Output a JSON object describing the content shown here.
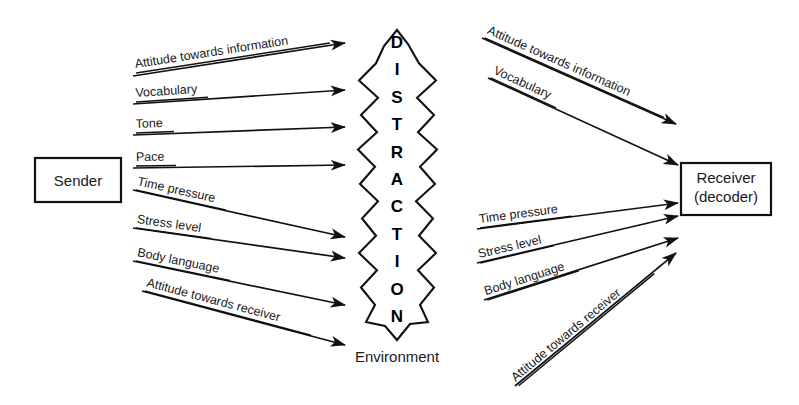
{
  "diagram": {
    "background_color": "#ffffff",
    "line_color": "#111111",
    "text_color": "#1a1a1a"
  },
  "nodes": {
    "sender": {
      "label": "Sender",
      "x": 35,
      "y": 158,
      "w": 86,
      "h": 44
    },
    "receiver": {
      "label_line1": "Receiver",
      "label_line2": "(decoder)",
      "x": 681,
      "y": 163,
      "w": 90,
      "h": 52
    },
    "barrier": {
      "letters": [
        "D",
        "I",
        "S",
        "T",
        "R",
        "A",
        "C",
        "T",
        "I",
        "O",
        "N"
      ],
      "caption": "Environment",
      "center_x": 397,
      "top_y": 30,
      "bottom_y": 340
    }
  },
  "left_flows": [
    {
      "label": "Attitude towards information",
      "x1": 133,
      "y1": 76,
      "x2": 345,
      "y2": 43,
      "label_x": 136,
      "label_y": 72,
      "angle": -8.8,
      "underline_w": 196
    },
    {
      "label": "Vocabulary",
      "x1": 133,
      "y1": 104,
      "x2": 345,
      "y2": 90,
      "label_x": 136,
      "label_y": 101,
      "angle": -3.8,
      "underline_w": 72
    },
    {
      "label": "Tone",
      "x1": 133,
      "y1": 135,
      "x2": 345,
      "y2": 127,
      "label_x": 136,
      "label_y": 132,
      "angle": -2.2,
      "underline_w": 38
    },
    {
      "label": "Pace",
      "x1": 133,
      "y1": 168,
      "x2": 345,
      "y2": 165,
      "label_x": 136,
      "label_y": 165,
      "angle": -0.8,
      "underline_w": 40
    },
    {
      "label": "Time pressure",
      "x1": 133,
      "y1": 190,
      "x2": 345,
      "y2": 237,
      "label_x": 136,
      "label_y": 189,
      "angle": 12.5,
      "underline_w": 92
    },
    {
      "label": "Stress level",
      "x1": 133,
      "y1": 228,
      "x2": 345,
      "y2": 258,
      "label_x": 136,
      "label_y": 227,
      "angle": 8.0,
      "underline_w": 76
    },
    {
      "label": "Body language",
      "x1": 133,
      "y1": 261,
      "x2": 345,
      "y2": 305,
      "label_x": 136,
      "label_y": 260,
      "angle": 11.7,
      "underline_w": 96
    },
    {
      "label": "Attitude towards receiver",
      "x1": 142,
      "y1": 291,
      "x2": 345,
      "y2": 345,
      "label_x": 145,
      "label_y": 290,
      "angle": 14.9,
      "underline_w": 172
    }
  ],
  "right_flows": [
    {
      "label": "Attitude towards information",
      "x1": 482,
      "y1": 38,
      "x2": 676,
      "y2": 124,
      "label_x": 485,
      "label_y": 37,
      "angle": 23.9,
      "underline_w": 196
    },
    {
      "label": "Vocabulary",
      "x1": 488,
      "y1": 78,
      "x2": 678,
      "y2": 165,
      "label_x": 491,
      "label_y": 77,
      "angle": 24.6,
      "underline_w": 72
    },
    {
      "label": "Time pressure",
      "x1": 477,
      "y1": 229,
      "x2": 678,
      "y2": 203,
      "label_x": 480,
      "label_y": 227,
      "angle": -7.4,
      "underline_w": 92
    },
    {
      "label": "Stress level",
      "x1": 477,
      "y1": 263,
      "x2": 678,
      "y2": 216,
      "label_x": 480,
      "label_y": 262,
      "angle": -13.2,
      "underline_w": 76
    },
    {
      "label": "Body language",
      "x1": 484,
      "y1": 300,
      "x2": 678,
      "y2": 238,
      "label_x": 487,
      "label_y": 299,
      "angle": -17.7,
      "underline_w": 96
    },
    {
      "label": "Attitude towards receiver",
      "x1": 515,
      "y1": 386,
      "x2": 676,
      "y2": 253,
      "label_x": 518,
      "label_y": 385,
      "angle": -39.6,
      "underline_w": 176
    }
  ]
}
